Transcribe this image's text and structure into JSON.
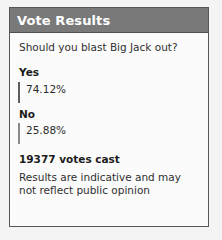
{
  "card": {
    "header": {
      "title": "Vote Results"
    },
    "question": "Should you blast Big Jack out?",
    "options": [
      {
        "label": "Yes",
        "percent_text": "74.12%",
        "percent": 74.12,
        "bar_width_px": 146,
        "bar_style": "strong"
      },
      {
        "label": "No",
        "percent_text": "25.88%",
        "percent": 25.88,
        "bar_width_px": 61,
        "bar_style": "weak"
      }
    ],
    "footer": {
      "votes_cast": "19377 votes cast",
      "disclaimer": "Results are indicative and may not reflect public opinion"
    }
  },
  "colors": {
    "header_bg": "#797979",
    "header_text": "#ffffff",
    "card_bg": "#fbfbfb",
    "card_border": "#575757",
    "page_bg": "#f4f4f4",
    "bar_strong": "#858585",
    "bar_weak": "#cfcfcf",
    "text": "#303030"
  },
  "chart_data": {
    "type": "bar",
    "title": "Vote Results",
    "subtitle": "Should you blast Big Jack out?",
    "categories": [
      "Yes",
      "No"
    ],
    "values": [
      74.12,
      25.88
    ],
    "xlabel": "",
    "ylabel": "Percent of votes",
    "ylim": [
      0,
      100
    ],
    "orientation": "horizontal",
    "grid": false,
    "legend": "none",
    "data_labels": [
      "74.12%",
      "25.88%"
    ],
    "annotations": [
      "19377 votes cast",
      "Results are indicative and may not reflect public opinion"
    ]
  }
}
